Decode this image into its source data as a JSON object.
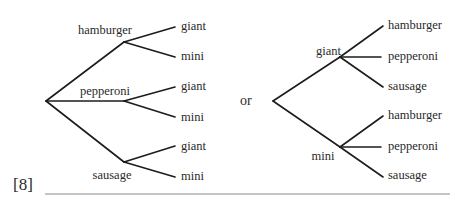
{
  "left_tree": {
    "first_level": [
      {
        "label": "hamburger",
        "children": [
          "giant",
          "mini"
        ]
      },
      {
        "label": "pepperoni",
        "children": [
          "giant",
          "mini"
        ]
      },
      {
        "label": "sausage",
        "children": [
          "giant",
          "mini"
        ]
      }
    ]
  },
  "connector": "or",
  "right_tree": {
    "first_level": [
      {
        "label": "giant",
        "children": [
          "hamburger",
          "pepperoni",
          "sausage"
        ]
      },
      {
        "label": "mini",
        "children": [
          "hamburger",
          "pepperoni",
          "sausage"
        ]
      }
    ]
  },
  "marks": "[8]",
  "colors": {
    "ink": "#1c1c1c",
    "rule": "#8a8a8a"
  }
}
